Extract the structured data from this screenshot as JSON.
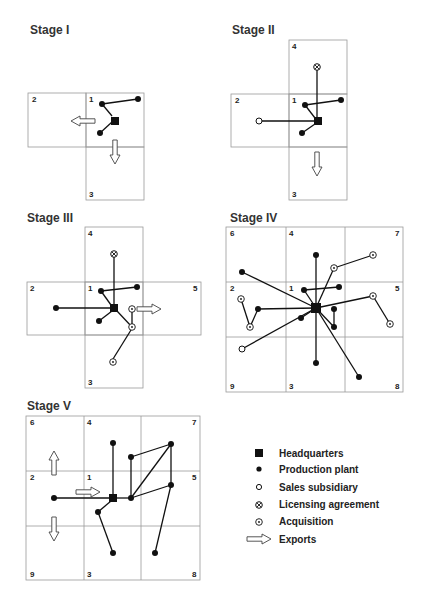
{
  "stages": [
    {
      "id": "stage-1",
      "title": "Stage I"
    },
    {
      "id": "stage-2",
      "title": "Stage II"
    },
    {
      "id": "stage-3",
      "title": "Stage III"
    },
    {
      "id": "stage-4",
      "title": "Stage IV"
    },
    {
      "id": "stage-5",
      "title": "Stage V"
    }
  ],
  "cells": {
    "stage1": [
      "1",
      "2",
      "3"
    ],
    "stage2": [
      "1",
      "2",
      "3",
      "4"
    ],
    "stage3": [
      "1",
      "2",
      "3",
      "4",
      "5"
    ],
    "stage4": [
      "1",
      "2",
      "3",
      "4",
      "5",
      "6",
      "7",
      "8",
      "9"
    ],
    "stage5": [
      "1",
      "2",
      "3",
      "4",
      "5",
      "6",
      "7",
      "8",
      "9"
    ]
  },
  "legend": {
    "items": [
      {
        "symbol": "headquarters",
        "label": "Headquarters"
      },
      {
        "symbol": "production-plant",
        "label": "Production plant"
      },
      {
        "symbol": "sales-subsidiary",
        "label": "Sales subsidiary"
      },
      {
        "symbol": "licensing-agreement",
        "label": "Licensing agreement"
      },
      {
        "symbol": "acquisition",
        "label": "Acquisition"
      },
      {
        "symbol": "exports",
        "label": "Exports"
      }
    ]
  },
  "colors": {
    "ink": "#111111",
    "grid": "#9a9a9a",
    "background": "#ffffff"
  }
}
